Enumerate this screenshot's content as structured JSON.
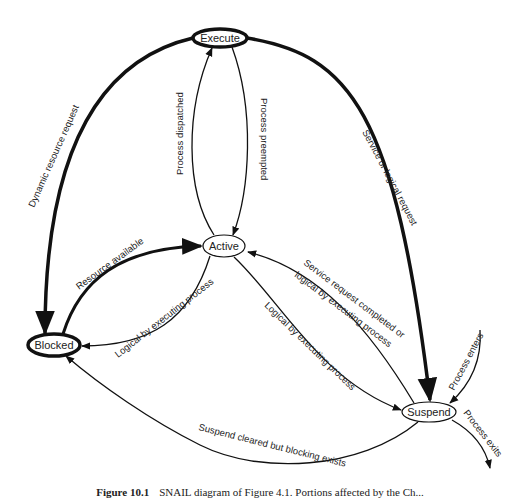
{
  "diagram": {
    "type": "state-transition",
    "nodes": [
      {
        "id": "execute",
        "label": "Execute",
        "cx": 220,
        "cy": 38,
        "rx": 27,
        "ry": 9,
        "stroke_width": 3.5
      },
      {
        "id": "active",
        "label": "Active",
        "cx": 224,
        "cy": 246,
        "rx": 21,
        "ry": 11,
        "stroke_width": 1.2
      },
      {
        "id": "blocked",
        "label": "Blocked",
        "cx": 54,
        "cy": 345,
        "rx": 26,
        "ry": 11,
        "stroke_width": 3.5
      },
      {
        "id": "suspend",
        "label": "Suspend",
        "cx": 429,
        "cy": 412,
        "rx": 27,
        "ry": 10,
        "stroke_width": 1.2
      }
    ],
    "edges": [
      {
        "id": "dynamic-resource-request",
        "from": "execute",
        "to": "blocked",
        "label": "Dynamic resource request",
        "weight": "thick"
      },
      {
        "id": "process-dispatched",
        "from": "active",
        "to": "execute",
        "label": "Process dispatched",
        "weight": "thin"
      },
      {
        "id": "process-preempted",
        "from": "execute",
        "to": "active",
        "label": "Process preempted",
        "weight": "thin"
      },
      {
        "id": "service-or-logical-request",
        "from": "execute",
        "to": "suspend",
        "label": "Service or logical request",
        "weight": "thick"
      },
      {
        "id": "resource-available",
        "from": "blocked",
        "to": "active",
        "label": "Resource available",
        "weight": "thick"
      },
      {
        "id": "logical-by-executing-process-1",
        "from": "active",
        "to": "blocked",
        "label": "Logical by executing process",
        "weight": "thin"
      },
      {
        "id": "service-request-completed",
        "from": "suspend",
        "to": "active",
        "label_line1": "Service request completed or",
        "label_line2": "logical by executing process",
        "weight": "thin"
      },
      {
        "id": "logical-by-executing-process-2",
        "from": "active",
        "to": "suspend",
        "label": "Logical by executing process",
        "weight": "thin"
      },
      {
        "id": "suspend-cleared",
        "from": "suspend",
        "to": "blocked",
        "label": "Suspend cleared but blocking exists",
        "weight": "thin"
      },
      {
        "id": "process-enters",
        "from": "external",
        "to": "suspend",
        "label": "Process enters",
        "weight": "thin"
      },
      {
        "id": "process-exits",
        "from": "suspend",
        "to": "external",
        "label": "Process exits",
        "weight": "thin"
      }
    ]
  },
  "caption": {
    "figure_number": "Figure 10.1",
    "text": "SNAIL diagram of Figure 4.1. Portions affected by the Ch..."
  }
}
